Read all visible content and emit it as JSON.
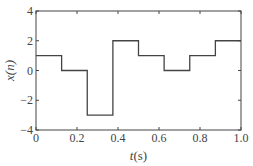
{
  "chart_data": {
    "type": "line",
    "style": "step",
    "title": "",
    "xlabel": "t(s)",
    "xlabel_italic_part": "t",
    "xlabel_rest": "(s)",
    "ylabel": "x(n)",
    "xlim": [
      0,
      1.0
    ],
    "ylim": [
      -4,
      4
    ],
    "xticks": [
      0,
      0.2,
      0.4,
      0.6,
      0.8,
      1.0
    ],
    "xtick_labels": [
      "0",
      "0.2",
      "0.4",
      "0.6",
      "0.8",
      "1.0"
    ],
    "yticks": [
      -4,
      -2,
      0,
      2,
      4
    ],
    "ytick_labels": [
      "-4",
      "-2",
      "0",
      "2",
      "4"
    ],
    "grid": false,
    "legend": null,
    "series": [
      {
        "name": "x(n)",
        "step_edges": [
          0,
          0.125,
          0.25,
          0.375,
          0.5,
          0.625,
          0.75,
          0.875,
          1.0
        ],
        "values": [
          1,
          0,
          -3,
          2,
          1,
          0,
          1,
          2
        ],
        "color": "#444444"
      }
    ]
  },
  "layout": {
    "frame": {
      "left": 36,
      "top": 11,
      "right": 241,
      "bottom": 130
    },
    "line_color": "#444444",
    "frame_color": "#444444"
  }
}
